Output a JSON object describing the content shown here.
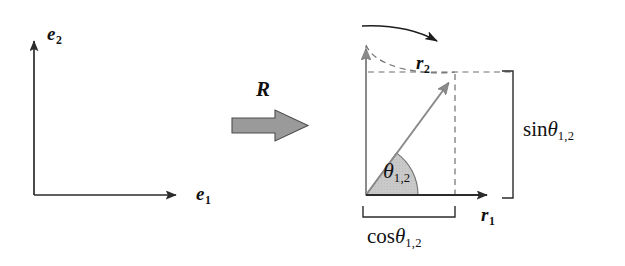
{
  "figure": {
    "canvas": {
      "width": 625,
      "height": 266,
      "background": "#ffffff"
    }
  },
  "colors": {
    "stroke_dark": "#2b2b2b",
    "stroke_gray": "#808080",
    "block_arrow_fill": "#9a9a9a",
    "block_arrow_stroke": "#4d4d4d",
    "sector_fill": "#c9c9c9",
    "sector_stroke": "#6f6f6f",
    "dashed": "#6f6f6f",
    "text": "#111111"
  },
  "left_panel": {
    "name": "original-basis-frame",
    "origin": {
      "x": 34,
      "y": 195
    },
    "axes": [
      {
        "id": "e1",
        "label": "e",
        "subscript": "1",
        "direction": "horizontal-right",
        "tip": {
          "x": 185,
          "y": 195
        },
        "label_pos": {
          "x": 196,
          "y": 184
        }
      },
      {
        "id": "e2",
        "label": "e",
        "subscript": "2",
        "direction": "vertical-up",
        "tip": {
          "x": 34,
          "y": 32
        },
        "label_pos": {
          "x": 47,
          "y": 24
        }
      }
    ]
  },
  "operator": {
    "name": "rotation-operator",
    "label": "R",
    "label_pos": {
      "x": 256,
      "y": 79
    },
    "block_arrow": {
      "x": 232,
      "y": 110,
      "width": 76,
      "height": 31,
      "shaft_height": 15
    }
  },
  "right_panel": {
    "name": "rotated-basis-frame",
    "origin": {
      "x": 366,
      "y": 195
    },
    "vectors": [
      {
        "id": "r1",
        "label": "r",
        "subscript": "1",
        "direction": "horizontal-right",
        "tip": {
          "x": 496,
          "y": 195
        },
        "label_pos": {
          "x": 481,
          "y": 205
        },
        "color": "dark"
      },
      {
        "id": "r2",
        "label": "r",
        "subscript": "2",
        "direction": "rotated",
        "tip": {
          "x": 455,
          "y": 72
        },
        "label_pos": {
          "x": 416,
          "y": 53
        },
        "color": "gray"
      }
    ],
    "ghost_axis": {
      "id": "e2-ghost",
      "tip": {
        "x": 366,
        "y": 40
      },
      "color": "gray"
    },
    "angle": {
      "id": "theta-1-2",
      "text": "θ",
      "subscript": "1,2",
      "label_pos": {
        "x": 383,
        "y": 160
      },
      "radius": 52,
      "degrees": 54
    },
    "rotation_arc": {
      "id": "rotation-sweep-arrow",
      "from": {
        "x": 369,
        "y": 27
      },
      "to": {
        "x": 455,
        "y": 48
      },
      "direction": "clockwise"
    },
    "measures": [
      {
        "id": "cos-measure",
        "text": "cos",
        "symbol": "θ",
        "subscript": "1,2",
        "orientation": "horizontal",
        "bracket": {
          "x1": 363,
          "x2": 455,
          "y": 217,
          "tick": 11
        },
        "label_pos": {
          "x": 367,
          "y": 226
        }
      },
      {
        "id": "sin-measure",
        "text": "sin",
        "symbol": "θ",
        "subscript": "1,2",
        "orientation": "vertical",
        "bracket": {
          "x": 513,
          "y1": 71,
          "y2": 198,
          "tick": 11
        },
        "label_pos": {
          "x": 523,
          "y": 119
        }
      }
    ],
    "guides": [
      {
        "id": "guide-top-horizontal",
        "from": {
          "x": 366,
          "y": 72
        },
        "to": {
          "x": 513,
          "y": 72
        }
      },
      {
        "id": "guide-left-vertical",
        "from": {
          "x": 366,
          "y": 195
        },
        "to": {
          "x": 366,
          "y": 40
        }
      },
      {
        "id": "guide-r2-vertical",
        "from": {
          "x": 455,
          "y": 72
        },
        "to": {
          "x": 455,
          "y": 198
        }
      },
      {
        "id": "guide-rotation-arc-dashed",
        "from": {
          "x": 366,
          "y": 46
        },
        "to": {
          "x": 455,
          "y": 72
        }
      }
    ]
  }
}
